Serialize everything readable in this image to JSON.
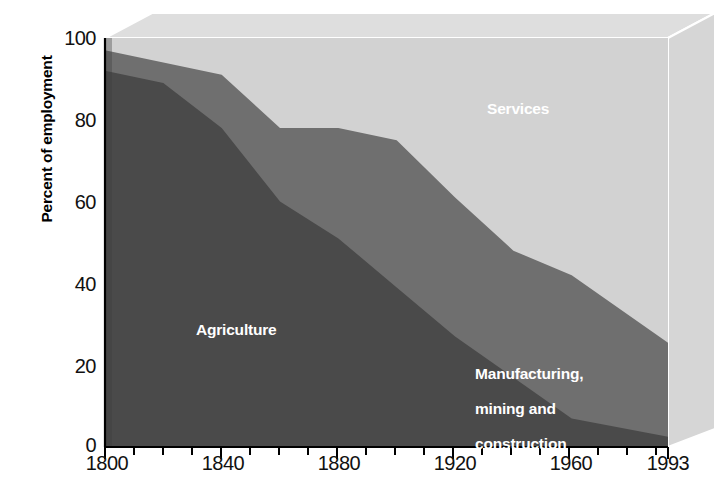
{
  "chart_data": {
    "type": "area",
    "title": "",
    "subtitle": "",
    "xlabel": "",
    "ylabel": "Percent of employment",
    "stacked": true,
    "percent_stacked": true,
    "grid": false,
    "legend_position": "inside-plot-labels",
    "x": [
      1800,
      1820,
      1840,
      1860,
      1880,
      1900,
      1920,
      1940,
      1960,
      1993
    ],
    "xlim": [
      1800,
      1993
    ],
    "ylim": [
      0,
      100
    ],
    "xticks": [
      "1800",
      "1840",
      "1880",
      "1920",
      "1960",
      "1993"
    ],
    "xtick_values": [
      1800,
      1840,
      1880,
      1920,
      1960,
      1993
    ],
    "xminorticks": [
      1810,
      1820,
      1830,
      1850,
      1860,
      1870,
      1890,
      1900,
      1910,
      1930,
      1940,
      1950,
      1970,
      1980,
      1990
    ],
    "yticks": [
      "0",
      "20",
      "40",
      "60",
      "80",
      "100"
    ],
    "ytick_values": [
      0,
      20,
      40,
      60,
      80,
      100
    ],
    "series": [
      {
        "name": "Agriculture",
        "color": "#4a4a4a",
        "values": [
          92,
          89,
          78,
          60,
          51,
          39,
          27,
          17,
          7,
          2.5
        ]
      },
      {
        "name": "Manufacturing, mining and construction",
        "color": "#6f6f6f",
        "values": [
          5,
          5,
          13,
          18,
          27,
          36,
          34,
          31,
          35,
          23
        ]
      },
      {
        "name": "Services",
        "color": "#d2d2d2",
        "values": [
          3,
          6,
          9,
          22,
          22,
          25,
          39,
          52,
          58,
          74.5
        ]
      }
    ],
    "annotations": [
      {
        "text": "Services",
        "series": "Services"
      },
      {
        "text": "Agriculture",
        "series": "Agriculture"
      },
      {
        "text": "Manufacturing,\nmining and\nconstruction",
        "series": "Manufacturing, mining and construction"
      }
    ]
  },
  "axes": {
    "y_axis_title": "Percent of employment",
    "y_tick_labels": [
      "100",
      "80",
      "60",
      "40",
      "20",
      "0"
    ],
    "x_tick_labels": [
      "1800",
      "1840",
      "1880",
      "1920",
      "1960",
      "1993"
    ]
  },
  "labels": {
    "services": "Services",
    "agriculture": "Agriculture",
    "manufacturing_line1": "Manufacturing,",
    "manufacturing_line2": "mining and",
    "manufacturing_line3": "construction"
  },
  "colors": {
    "agriculture": "#4a4a4a",
    "manufacturing": "#6f6f6f",
    "services": "#d2d2d2",
    "wall_top": "#dcdcdc",
    "wall_right": "#d8d8d8",
    "axis": "#000000",
    "background": "#ffffff"
  }
}
